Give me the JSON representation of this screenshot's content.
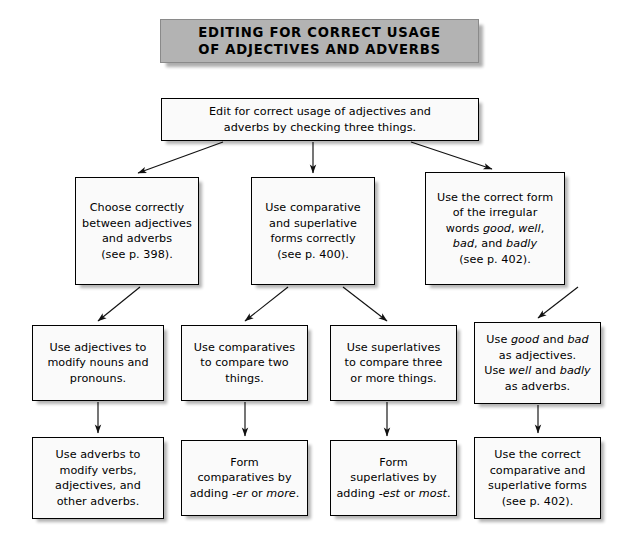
{
  "diagram": {
    "title_line1": "EDITING FOR CORRECT USAGE",
    "title_line2": "OF ADJECTIVES AND ADVERBS",
    "title_full": "EDITING FOR CORRECT USAGE\nOF ADJECTIVES AND ADVERBS",
    "colors": {
      "banner_fill": "#b3b3b3",
      "box_fill": "#fafafa",
      "box_border": "#000000",
      "arrow": "#000000",
      "text": "#000000",
      "page_background": "#ffffff"
    },
    "nodes": {
      "intro": {
        "id": "intro",
        "text": "Edit for correct usage of adjectives and\nadverbs by checking three things."
      },
      "branch1": {
        "id": "branch1",
        "text": "Choose correctly\nbetween adjectives\nand adverbs\n(see p. 398).",
        "page_reference": "398"
      },
      "branch2": {
        "id": "branch2",
        "text": "Use comparative\nand superlative\nforms correctly\n(see p. 400).",
        "page_reference": "400"
      },
      "branch3": {
        "id": "branch3",
        "page_reference": "402",
        "lines": [
          [
            {
              "t": "Use the correct form",
              "i": false
            }
          ],
          [
            {
              "t": "of the irregular",
              "i": false
            }
          ],
          [
            {
              "t": "words ",
              "i": false
            },
            {
              "t": "good",
              "i": true
            },
            {
              "t": ", ",
              "i": false
            },
            {
              "t": "well",
              "i": true
            },
            {
              "t": ",",
              "i": false
            }
          ],
          [
            {
              "t": "bad",
              "i": true
            },
            {
              "t": ", and ",
              "i": false
            },
            {
              "t": "badly",
              "i": true
            }
          ],
          [
            {
              "t": "(see p. 402).",
              "i": false
            }
          ]
        ]
      },
      "detail1": {
        "id": "detail1",
        "text": "Use adjectives to\nmodify nouns and\npronouns."
      },
      "detail2": {
        "id": "detail2",
        "text": "Use comparatives\nto compare two\nthings."
      },
      "detail3": {
        "id": "detail3",
        "text": "Use superlatives\nto compare three\nor more things."
      },
      "detail4": {
        "id": "detail4",
        "lines": [
          [
            {
              "t": "Use ",
              "i": false
            },
            {
              "t": "good",
              "i": true
            },
            {
              "t": " and ",
              "i": false
            },
            {
              "t": "bad",
              "i": true
            }
          ],
          [
            {
              "t": "as adjectives.",
              "i": false
            }
          ],
          [
            {
              "t": "Use ",
              "i": false
            },
            {
              "t": "well",
              "i": true
            },
            {
              "t": " and ",
              "i": false
            },
            {
              "t": "badly",
              "i": true
            }
          ],
          [
            {
              "t": "as adverbs.",
              "i": false
            }
          ]
        ]
      },
      "result1": {
        "id": "result1",
        "text": "Use  adverbs to\nmodify verbs,\nadjectives, and\nother adverbs."
      },
      "result2": {
        "id": "result2",
        "lines": [
          [
            {
              "t": "Form",
              "i": false
            }
          ],
          [
            {
              "t": "comparatives by",
              "i": false
            }
          ],
          [
            {
              "t": "adding ",
              "i": false
            },
            {
              "t": "-er",
              "i": true
            },
            {
              "t": " or ",
              "i": false
            },
            {
              "t": "more",
              "i": true
            },
            {
              "t": ".",
              "i": false
            }
          ]
        ]
      },
      "result3": {
        "id": "result3",
        "lines": [
          [
            {
              "t": "Form",
              "i": false
            }
          ],
          [
            {
              "t": "superlatives by",
              "i": false
            }
          ],
          [
            {
              "t": "adding ",
              "i": false
            },
            {
              "t": "-est",
              "i": true
            },
            {
              "t": " or ",
              "i": false
            },
            {
              "t": "most",
              "i": true
            },
            {
              "t": ".",
              "i": false
            }
          ]
        ]
      },
      "result4": {
        "id": "result4",
        "text": "Use the correct\ncomparative and\nsuperlative forms\n(see p. 402).",
        "page_reference": "402"
      }
    },
    "connections": [
      {
        "from": "intro",
        "to": "branch1",
        "style": "diagonal-arrow"
      },
      {
        "from": "intro",
        "to": "branch2",
        "style": "vertical-arrow"
      },
      {
        "from": "intro",
        "to": "branch3",
        "style": "diagonal-arrow"
      },
      {
        "from": "branch1",
        "to": "detail1",
        "style": "diagonal-arrow"
      },
      {
        "from": "branch2",
        "to": "detail2",
        "style": "diagonal-arrow"
      },
      {
        "from": "branch2",
        "to": "detail3",
        "style": "diagonal-arrow"
      },
      {
        "from": "branch3",
        "to": "detail4",
        "style": "diagonal-arrow"
      },
      {
        "from": "detail1",
        "to": "result1",
        "style": "vertical-arrow"
      },
      {
        "from": "detail2",
        "to": "result2",
        "style": "vertical-arrow"
      },
      {
        "from": "detail3",
        "to": "result3",
        "style": "vertical-arrow"
      },
      {
        "from": "detail4",
        "to": "result4",
        "style": "vertical-arrow"
      }
    ]
  }
}
